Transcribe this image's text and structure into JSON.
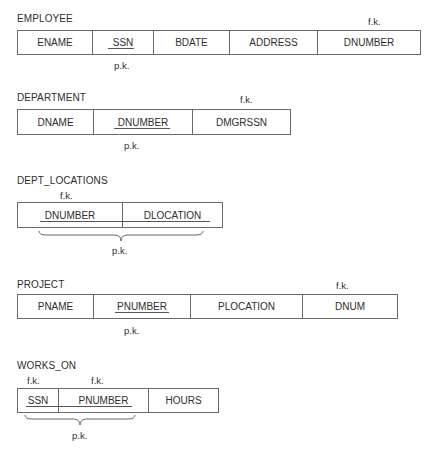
{
  "diagram": {
    "type": "relational-schema",
    "relations": [
      {
        "name": "EMPLOYEE",
        "attributes": [
          "ENAME",
          "SSN",
          "BDATE",
          "ADDRESS",
          "DNUMBER"
        ],
        "primary_key": [
          "SSN"
        ],
        "foreign_keys": [
          "DNUMBER"
        ],
        "pk_label": "p.k.",
        "fk_labels": [
          "f.k."
        ]
      },
      {
        "name": "DEPARTMENT",
        "attributes": [
          "DNAME",
          "DNUMBER",
          "DMGRSSN"
        ],
        "primary_key": [
          "DNUMBER"
        ],
        "foreign_keys": [
          "DMGRSSN"
        ],
        "pk_label": "p.k.",
        "fk_labels": [
          "f.k."
        ]
      },
      {
        "name": "DEPT_LOCATIONS",
        "attributes": [
          "DNUMBER",
          "DLOCATION"
        ],
        "primary_key": [
          "DNUMBER",
          "DLOCATION"
        ],
        "foreign_keys": [
          "DNUMBER"
        ],
        "pk_label": "p.k.",
        "fk_labels": [
          "f.k."
        ]
      },
      {
        "name": "PROJECT",
        "attributes": [
          "PNAME",
          "PNUMBER",
          "PLOCATION",
          "DNUM"
        ],
        "primary_key": [
          "PNUMBER"
        ],
        "foreign_keys": [
          "DNUM"
        ],
        "pk_label": "p.k.",
        "fk_labels": [
          "f.k."
        ]
      },
      {
        "name": "WORKS_ON",
        "attributes": [
          "SSN",
          "PNUMBER",
          "HOURS"
        ],
        "primary_key": [
          "SSN",
          "PNUMBER"
        ],
        "foreign_keys": [
          "SSN",
          "PNUMBER"
        ],
        "pk_label": "p.k.",
        "fk_labels": [
          "f.k.",
          "f.k."
        ]
      }
    ]
  }
}
